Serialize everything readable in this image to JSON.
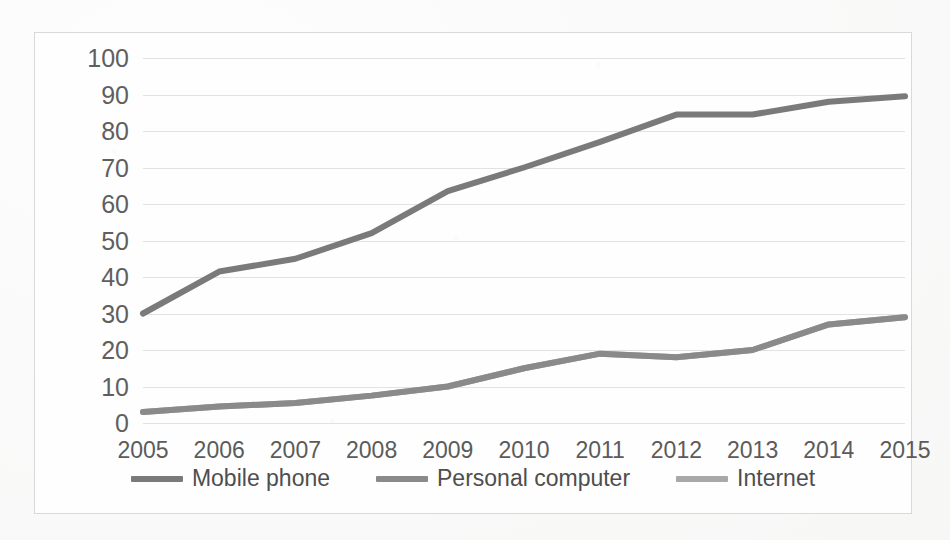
{
  "chart_data": {
    "type": "line",
    "title": "",
    "subtitle": "",
    "xlabel": "",
    "ylabel": "",
    "categories": [
      "2005",
      "2006",
      "2007",
      "2008",
      "2009",
      "2010",
      "2011",
      "2012",
      "2013",
      "2014",
      "2015"
    ],
    "x": [
      2005,
      2006,
      2007,
      2008,
      2009,
      2010,
      2011,
      2012,
      2013,
      2014,
      2015
    ],
    "ylim": [
      0,
      100
    ],
    "xlim": [
      2005,
      2015
    ],
    "y_ticks": [
      0,
      10,
      20,
      30,
      40,
      50,
      60,
      70,
      80,
      90,
      100
    ],
    "y_tick_labels": [
      "0",
      "10",
      "20",
      "30",
      "40",
      "50",
      "60",
      "70",
      "80",
      "90",
      "100"
    ],
    "x_tick_labels": [
      "2005",
      "2006",
      "2007",
      "2008",
      "2009",
      "2010",
      "2011",
      "2012",
      "2013",
      "2014",
      "2015"
    ],
    "grid": true,
    "grid_axis": "y",
    "legend_position": "bottom",
    "series": [
      {
        "name": "Mobile phone",
        "color": "#7a7a7a",
        "values": [
          30,
          41.5,
          45,
          52,
          63.5,
          70,
          77,
          84.5,
          84.5,
          88,
          89.5
        ]
      },
      {
        "name": "Personal computer",
        "color": "#8a8a8a",
        "values": [
          3,
          4.5,
          5.5,
          7.5,
          10,
          15,
          19,
          18,
          20,
          27,
          29
        ]
      },
      {
        "name": "Internet",
        "color": "#a8a8a8",
        "values": [
          3,
          4.5,
          5.5,
          7.5,
          10,
          15,
          19,
          18,
          20,
          27,
          29
        ]
      }
    ]
  },
  "legend": {
    "items": [
      {
        "label": "Mobile phone",
        "color": "#7a7a7a"
      },
      {
        "label": "Personal computer",
        "color": "#8a8a8a"
      },
      {
        "label": "Internet",
        "color": "#a8a8a8"
      }
    ]
  },
  "colors": {
    "grid": "#e2e2e2",
    "frame": "#d9d9d9",
    "axis_text": "#5b5b5b",
    "background": "#fefefe"
  }
}
